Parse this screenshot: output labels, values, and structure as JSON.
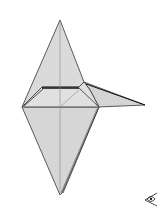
{
  "diagram": {
    "type": "origami-fold-step",
    "colors": {
      "paper_fill": "#d9d9d9",
      "paper_fill_light": "#e2e2e2",
      "edge": "#333333",
      "crease": "#8a8a8a",
      "background": "#ffffff"
    },
    "symbols": [
      {
        "name": "eye-view-symbol",
        "meaning": "view direction indicator"
      }
    ]
  }
}
